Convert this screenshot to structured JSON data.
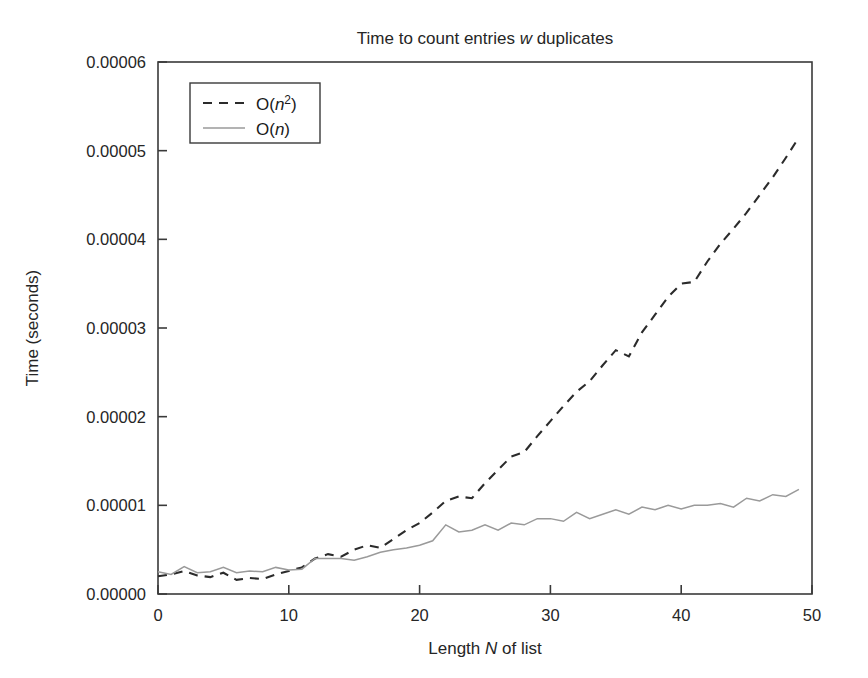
{
  "figure": {
    "title_prefix": "Time to count entries ",
    "title_italic": "w",
    "title_suffix": " duplicates",
    "title_full": "Time to count entries w duplicates",
    "background_color": "#ffffff"
  },
  "axes": {
    "x_label_prefix": "Length ",
    "x_label_italic": "N",
    "x_label_suffix": " of list",
    "x_label_full": "Length N of list",
    "y_label": "Time (seconds)",
    "x_ticks": [
      "0",
      "10",
      "20",
      "30",
      "40",
      "50"
    ],
    "y_ticks": [
      "0.00000",
      "0.00001",
      "0.00002",
      "0.00003",
      "0.00004",
      "0.00005",
      "0.00006"
    ]
  },
  "legend": {
    "entries": [
      {
        "label_prefix": "O(",
        "label_italic": "n",
        "label_sup": "2",
        "label_suffix": ")",
        "label_full": "O(n2)",
        "style": "dashed",
        "color": "#2b2b2b"
      },
      {
        "label_prefix": "O(",
        "label_italic": "n",
        "label_sup": "",
        "label_suffix": ")",
        "label_full": "O(n)",
        "style": "solid",
        "color": "#9a9a9a"
      }
    ]
  },
  "chart_data": {
    "type": "line",
    "title": "Time to count entries w duplicates",
    "xlabel": "Length N of list",
    "ylabel": "Time (seconds)",
    "xlim": [
      0,
      50
    ],
    "ylim": [
      0,
      6e-05
    ],
    "xticks": [
      0,
      10,
      20,
      30,
      40,
      50
    ],
    "yticks": [
      0,
      1e-05,
      2e-05,
      3e-05,
      4e-05,
      5e-05,
      6e-05
    ],
    "grid": false,
    "legend_position": "upper left",
    "x": [
      0,
      1,
      2,
      3,
      4,
      5,
      6,
      7,
      8,
      9,
      10,
      11,
      12,
      13,
      14,
      15,
      16,
      17,
      18,
      19,
      20,
      21,
      22,
      23,
      24,
      25,
      26,
      27,
      28,
      29,
      30,
      31,
      32,
      33,
      34,
      35,
      36,
      37,
      38,
      39,
      40,
      41,
      42,
      43,
      44,
      45,
      46,
      47,
      48,
      49
    ],
    "series": [
      {
        "name": "O(n2)",
        "style": "dashed",
        "color": "#2b2b2b",
        "values": [
          2e-06,
          2.2e-06,
          2.6e-06,
          2.1e-06,
          1.9e-06,
          2.4e-06,
          1.6e-06,
          1.8e-06,
          1.7e-06,
          2.2e-06,
          2.6e-06,
          3e-06,
          4e-06,
          4.5e-06,
          4.2e-06,
          5e-06,
          5.5e-06,
          5.2e-06,
          6.2e-06,
          7.2e-06,
          8e-06,
          9.2e-06,
          1.05e-05,
          1.1e-05,
          1.08e-05,
          1.25e-05,
          1.4e-05,
          1.55e-05,
          1.6e-05,
          1.78e-05,
          1.95e-05,
          2.12e-05,
          2.28e-05,
          2.4e-05,
          2.58e-05,
          2.75e-05,
          2.68e-05,
          2.95e-05,
          3.15e-05,
          3.35e-05,
          3.5e-05,
          3.52e-05,
          3.75e-05,
          3.95e-05,
          4.12e-05,
          4.3e-05,
          4.5e-05,
          4.7e-05,
          4.92e-05,
          5.15e-05
        ]
      },
      {
        "name": "O(n)",
        "style": "solid",
        "color": "#9a9a9a",
        "values": [
          2.5e-06,
          2.2e-06,
          3.1e-06,
          2.4e-06,
          2.5e-06,
          3e-06,
          2.4e-06,
          2.6e-06,
          2.5e-06,
          3e-06,
          2.7e-06,
          2.8e-06,
          4e-06,
          4e-06,
          4e-06,
          3.8e-06,
          4.2e-06,
          4.7e-06,
          5e-06,
          5.2e-06,
          5.5e-06,
          6e-06,
          7.8e-06,
          7e-06,
          7.2e-06,
          7.8e-06,
          7.2e-06,
          8e-06,
          7.8e-06,
          8.5e-06,
          8.5e-06,
          8.2e-06,
          9.2e-06,
          8.5e-06,
          9e-06,
          9.5e-06,
          9e-06,
          9.8e-06,
          9.5e-06,
          1e-05,
          9.6e-06,
          1e-05,
          1e-05,
          1.02e-05,
          9.8e-06,
          1.08e-05,
          1.05e-05,
          1.12e-05,
          1.1e-05,
          1.18e-05
        ]
      }
    ]
  }
}
